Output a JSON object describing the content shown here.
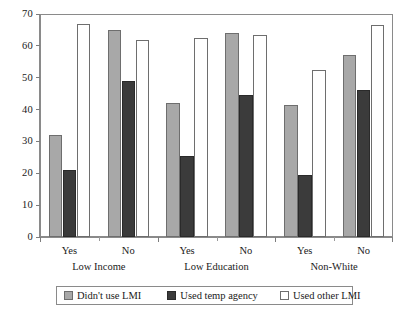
{
  "chart_data": {
    "type": "bar",
    "title": "",
    "subtitle": "",
    "xlabel": "",
    "ylabel": "",
    "ylim": [
      0,
      70
    ],
    "yticks": [
      0,
      10,
      20,
      30,
      40,
      50,
      60,
      70
    ],
    "ytick_labels": [
      "0",
      "10",
      "20",
      "30",
      "40",
      "50",
      "60",
      "70"
    ],
    "grid": false,
    "legend_position": "bottom",
    "categories": [
      "Yes",
      "No",
      "Yes",
      "No",
      "Yes",
      "No"
    ],
    "group_labels": [
      "Low Income",
      "Low Education",
      "Non-White"
    ],
    "groups": [
      {
        "label": "Low Income",
        "subgroups": [
          {
            "label": "Yes",
            "values": [
              32,
              21,
              67
            ]
          },
          {
            "label": "No",
            "values": [
              65,
              49,
              62
            ]
          }
        ]
      },
      {
        "label": "Low Education",
        "subgroups": [
          {
            "label": "Yes",
            "values": [
              42,
              25.5,
              62.5
            ]
          },
          {
            "label": "No",
            "values": [
              64,
              44.5,
              63.5
            ]
          }
        ]
      },
      {
        "label": "Non-White",
        "subgroups": [
          {
            "label": "Yes",
            "values": [
              41.5,
              19.5,
              52.5
            ]
          },
          {
            "label": "No",
            "values": [
              57,
              46,
              66.5
            ]
          }
        ]
      }
    ],
    "series": [
      {
        "name": "Didn't use LMI",
        "color": "#a8a8a8",
        "values": [
          32,
          65,
          42,
          64,
          41.5,
          57
        ]
      },
      {
        "name": "Used temp agency",
        "color": "#3b3b3b",
        "values": [
          21,
          49,
          25.5,
          44.5,
          19.5,
          46
        ]
      },
      {
        "name": "Used other LMI",
        "color": "#ffffff",
        "values": [
          67,
          62,
          62.5,
          63.5,
          52.5,
          66.5
        ]
      }
    ]
  },
  "legend": {
    "items": [
      {
        "label": "Didn't use LMI",
        "swatch": "light-gray-swatch"
      },
      {
        "label": "Used temp agency",
        "swatch": "dark-gray-swatch"
      },
      {
        "label": "Used other LMI",
        "swatch": "white-swatch"
      }
    ]
  },
  "colors": {
    "series_didnt_use_lmi": "#a8a8a8",
    "series_used_temp_agency": "#3b3b3b",
    "series_used_other_lmi": "#ffffff",
    "axis": "#8a8a8a",
    "text": "#1a1a1a",
    "background": "#ffffff"
  }
}
